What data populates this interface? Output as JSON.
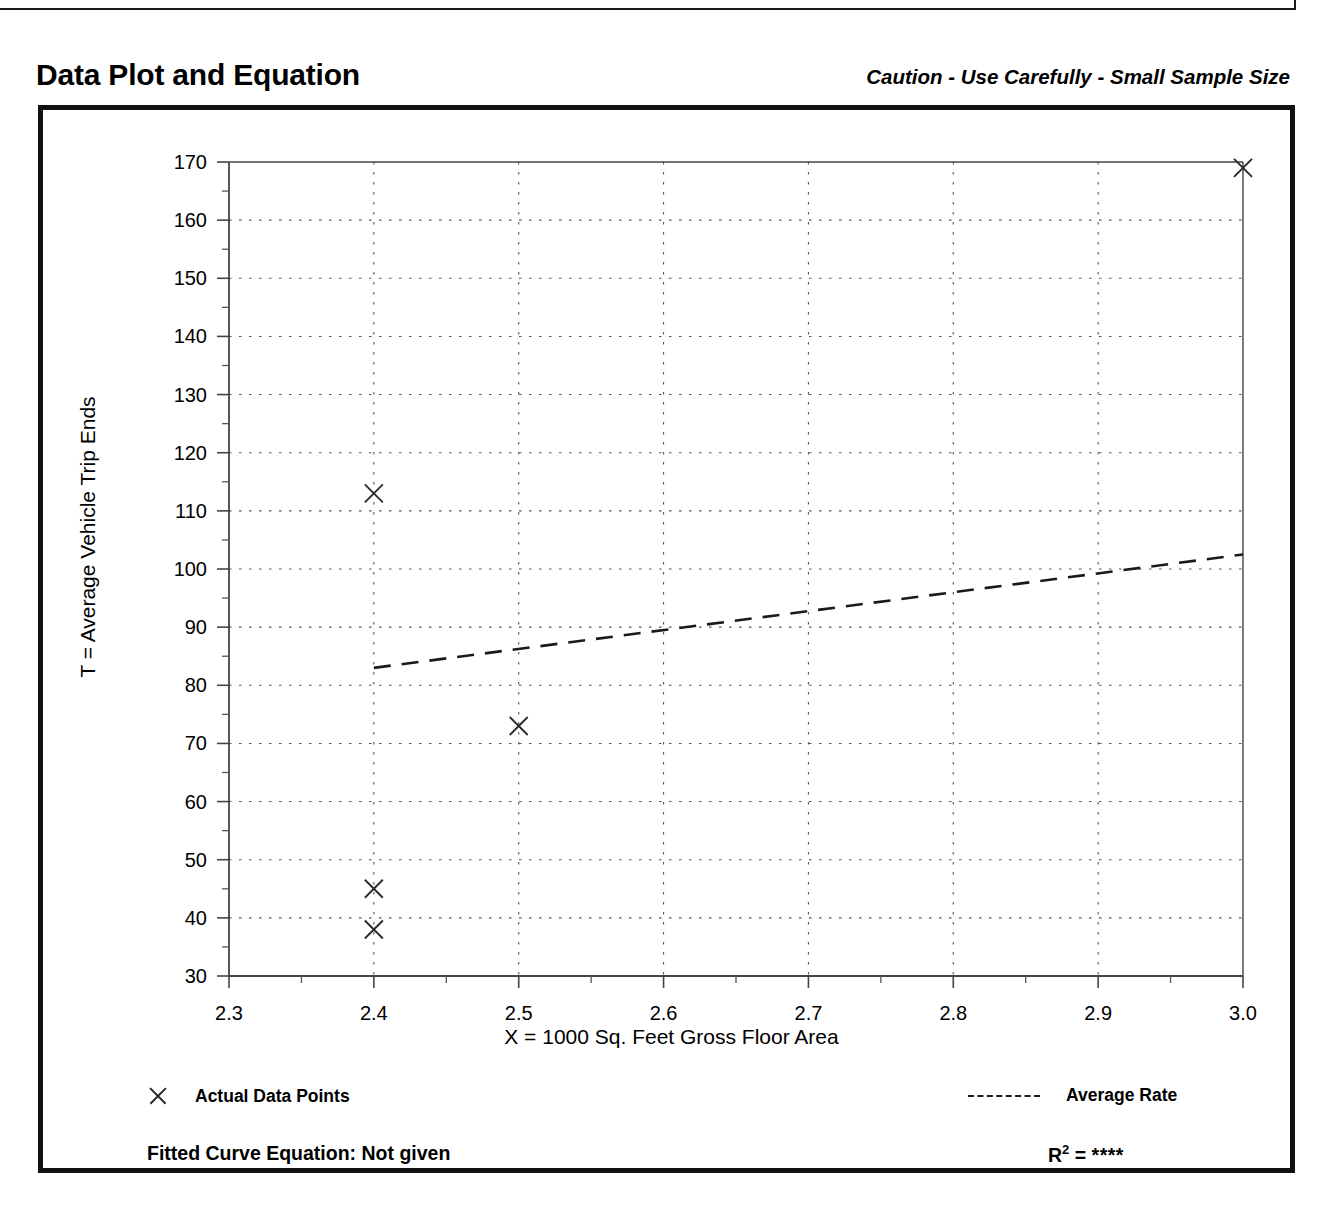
{
  "header": {
    "title": "Data Plot and Equation",
    "caution": "Caution - Use Carefully - Small Sample Size"
  },
  "legend": {
    "data_points_label": "Actual Data Points",
    "average_rate_label": "Average Rate"
  },
  "footer": {
    "equation_label": "Fitted Curve Equation:  Not given",
    "r2_prefix": "R",
    "r2_exponent": "2",
    "r2_equals": " = ",
    "r2_value": "****"
  },
  "chart_data": {
    "type": "scatter",
    "title": "Data Plot and Equation",
    "xlabel": "X = 1000 Sq. Feet Gross Floor Area",
    "ylabel": "T = Average Vehicle Trip Ends",
    "xlim": [
      2.3,
      3.0
    ],
    "ylim": [
      30,
      170
    ],
    "xticks": [
      "2.3",
      "2.4",
      "2.5",
      "2.6",
      "2.7",
      "2.8",
      "2.9",
      "3.0"
    ],
    "xtick_values": [
      2.3,
      2.4,
      2.5,
      2.6,
      2.7,
      2.8,
      2.9,
      3.0
    ],
    "x_minor_step": 0.05,
    "yticks": [
      "30",
      "40",
      "50",
      "60",
      "70",
      "80",
      "90",
      "100",
      "110",
      "120",
      "130",
      "140",
      "150",
      "160",
      "170"
    ],
    "ytick_values": [
      30,
      40,
      50,
      60,
      70,
      80,
      90,
      100,
      110,
      120,
      130,
      140,
      150,
      160,
      170
    ],
    "y_minor_step": 5,
    "grid": true,
    "grid_style": "dotted",
    "legend_position": "below-axes",
    "series": [
      {
        "name": "Actual Data Points",
        "type": "scatter",
        "marker": "x",
        "points": [
          {
            "x": 2.4,
            "y": 113
          },
          {
            "x": 2.4,
            "y": 45
          },
          {
            "x": 2.4,
            "y": 38
          },
          {
            "x": 2.5,
            "y": 73
          },
          {
            "x": 3.0,
            "y": 169
          }
        ]
      },
      {
        "name": "Average Rate",
        "type": "line",
        "linestyle": "dashed",
        "points": [
          {
            "x": 2.4,
            "y": 83
          },
          {
            "x": 3.0,
            "y": 102.5
          }
        ]
      }
    ],
    "annotations": {
      "caution": "Caution - Use Carefully - Small Sample Size",
      "fitted_curve_equation": "Not given",
      "r_squared": "****"
    }
  }
}
